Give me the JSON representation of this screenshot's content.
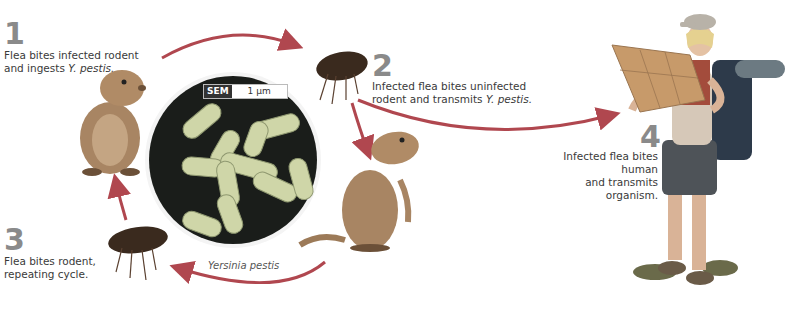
{
  "diagram": {
    "accent_color": "#b0474f",
    "steps": [
      {
        "number": "1",
        "text_a": "Flea bites infected rodent",
        "text_b": "and ingests ",
        "text_b_italic": "Y. pestis."
      },
      {
        "number": "2",
        "text_a": "Infected flea bites uninfected",
        "text_b": "rodent and transmits ",
        "text_b_italic": "Y. pestis."
      },
      {
        "number": "3",
        "text_a": "Flea bites rodent,",
        "text_b": "repeating cycle.",
        "text_b_italic": ""
      },
      {
        "number": "4",
        "text_a": "Infected flea bites human",
        "text_b": "and transmits organism.",
        "text_b_italic": ""
      }
    ],
    "micrograph": {
      "tag": "SEM",
      "scale": "1 µm",
      "caption": "Yersinia pestis"
    },
    "figures": {
      "rodent_1": "prairie-dog-sitting",
      "flea_2": "flea",
      "rodent_2": "prairie-dog-standing",
      "flea_3": "flea",
      "human": "hiker-with-map"
    }
  }
}
